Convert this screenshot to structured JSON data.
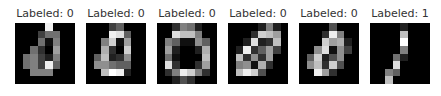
{
  "figure": {
    "panels": [
      {
        "title": "Labeled: 0",
        "label": 0,
        "pixels": [
          [
            0,
            0,
            0,
            0,
            15,
            0,
            0,
            0
          ],
          [
            0,
            0,
            0,
            4,
            7,
            7,
            0,
            0
          ],
          [
            0,
            0,
            0,
            7,
            1,
            8,
            0,
            0
          ],
          [
            0,
            0,
            7,
            3,
            0,
            10,
            0,
            0
          ],
          [
            0,
            7,
            8,
            4,
            2,
            8,
            0,
            0
          ],
          [
            0,
            7,
            8,
            4,
            15,
            6,
            0,
            0
          ],
          [
            0,
            0,
            8,
            8,
            8,
            0,
            0,
            0
          ],
          [
            0,
            0,
            0,
            0,
            0,
            0,
            0,
            0
          ]
        ]
      },
      {
        "title": "Labeled: 0",
        "label": 0,
        "pixels": [
          [
            0,
            0,
            0,
            4,
            6,
            0,
            0,
            0
          ],
          [
            0,
            0,
            0,
            15,
            14,
            6,
            0,
            0
          ],
          [
            0,
            0,
            8,
            13,
            1,
            10,
            0,
            0
          ],
          [
            0,
            0,
            11,
            3,
            0,
            13,
            0,
            0
          ],
          [
            0,
            6,
            12,
            2,
            3,
            9,
            0,
            0
          ],
          [
            0,
            9,
            9,
            7,
            6,
            6,
            0,
            0
          ],
          [
            0,
            0,
            12,
            16,
            15,
            2,
            0,
            0
          ],
          [
            0,
            0,
            0,
            0,
            0,
            0,
            0,
            0
          ]
        ]
      },
      {
        "title": "Labeled: 0",
        "label": 0,
        "pixels": [
          [
            0,
            0,
            3,
            8,
            7,
            2,
            0,
            0
          ],
          [
            0,
            0,
            14,
            12,
            12,
            8,
            0,
            0
          ],
          [
            0,
            8,
            6,
            1,
            1,
            9,
            6,
            0
          ],
          [
            0,
            10,
            2,
            0,
            0,
            2,
            11,
            0
          ],
          [
            0,
            7,
            1,
            0,
            0,
            0,
            12,
            0
          ],
          [
            0,
            14,
            3,
            0,
            0,
            3,
            10,
            0
          ],
          [
            0,
            3,
            8,
            15,
            13,
            8,
            3,
            0
          ],
          [
            0,
            0,
            2,
            5,
            3,
            0,
            0,
            0
          ]
        ]
      },
      {
        "title": "Labeled: 0",
        "label": 0,
        "pixels": [
          [
            0,
            0,
            0,
            0,
            2,
            8,
            2,
            0
          ],
          [
            0,
            0,
            0,
            3,
            13,
            12,
            10,
            0
          ],
          [
            0,
            0,
            2,
            14,
            2,
            3,
            12,
            0
          ],
          [
            0,
            2,
            15,
            3,
            6,
            10,
            4,
            0
          ],
          [
            0,
            12,
            3,
            9,
            3,
            10,
            0,
            0
          ],
          [
            0,
            8,
            9,
            1,
            11,
            3,
            0,
            0
          ],
          [
            0,
            12,
            15,
            13,
            5,
            0,
            0,
            0
          ],
          [
            0,
            0,
            0,
            0,
            0,
            0,
            0,
            0
          ]
        ]
      },
      {
        "title": "Labeled: 0",
        "label": 0,
        "pixels": [
          [
            0,
            0,
            0,
            0,
            5,
            0,
            0,
            0
          ],
          [
            0,
            0,
            0,
            3,
            15,
            8,
            0,
            0
          ],
          [
            0,
            0,
            0,
            13,
            10,
            11,
            2,
            0
          ],
          [
            0,
            0,
            9,
            14,
            1,
            9,
            4,
            0
          ],
          [
            0,
            6,
            13,
            2,
            5,
            9,
            0,
            0
          ],
          [
            0,
            9,
            12,
            3,
            13,
            5,
            0,
            0
          ],
          [
            0,
            0,
            15,
            10,
            3,
            0,
            0,
            0
          ],
          [
            0,
            0,
            0,
            0,
            0,
            0,
            0,
            0
          ]
        ]
      },
      {
        "title": "Labeled: 1",
        "label": 1,
        "pixels": [
          [
            0,
            0,
            0,
            0,
            2,
            0,
            0,
            0
          ],
          [
            0,
            0,
            0,
            0,
            12,
            0,
            0,
            0
          ],
          [
            0,
            0,
            0,
            0,
            16,
            0,
            0,
            0
          ],
          [
            0,
            0,
            0,
            0,
            8,
            0,
            0,
            0
          ],
          [
            0,
            0,
            0,
            7,
            2,
            0,
            0,
            0
          ],
          [
            0,
            0,
            0,
            14,
            0,
            0,
            0,
            0
          ],
          [
            0,
            0,
            8,
            6,
            0,
            0,
            0,
            0
          ],
          [
            0,
            0,
            12,
            0,
            0,
            0,
            0,
            0
          ]
        ]
      }
    ],
    "colormap": "gray",
    "value_range": [
      0,
      16
    ]
  }
}
